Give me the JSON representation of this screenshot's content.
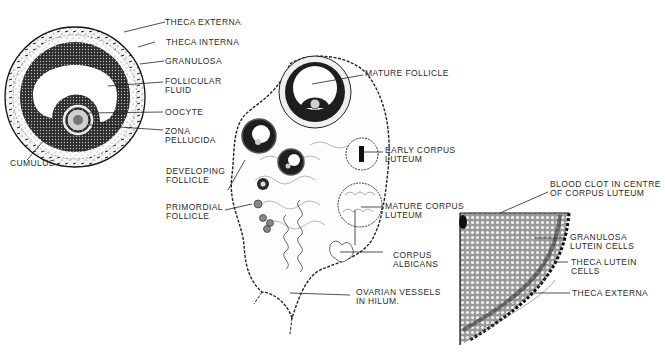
{
  "figure": {
    "type": "anatomical-illustration",
    "colors": {
      "ink": "#1a1a1a",
      "background": "#ffffff",
      "label": "#2a2a2a"
    }
  },
  "panels": {
    "follicle_detail": {
      "labels": [
        {
          "id": "theca-externa",
          "lines": [
            "THECA EXTERNA"
          ]
        },
        {
          "id": "theca-interna",
          "lines": [
            "THECA  INTERNA"
          ]
        },
        {
          "id": "granulosa",
          "lines": [
            "GRANULOSA"
          ]
        },
        {
          "id": "follicular-fluid",
          "lines": [
            "FOLLICULAR",
            "FLUID"
          ]
        },
        {
          "id": "oocyte",
          "lines": [
            "OOCYTE"
          ]
        },
        {
          "id": "zona-pellucida",
          "lines": [
            "ZONA",
            "PELLUCIDA"
          ]
        },
        {
          "id": "cumulus",
          "lines": [
            "CUMULUS"
          ]
        }
      ]
    },
    "ovary_section": {
      "labels": [
        {
          "id": "developing-follicle",
          "lines": [
            "DEVELOPING",
            "FOLLICLE"
          ]
        },
        {
          "id": "primordial-follicle",
          "lines": [
            "PRIMORDIAL",
            "FOLLICLE"
          ]
        },
        {
          "id": "mature-follicle",
          "lines": [
            "MATURE FOLLICLE"
          ]
        },
        {
          "id": "early-corpus-luteum",
          "lines": [
            "EARLY CORPUS",
            "LUTEUM"
          ]
        },
        {
          "id": "mature-corpus-luteum",
          "lines": [
            "MATURE CORPUS",
            "LUTEUM"
          ]
        },
        {
          "id": "corpus-albicans",
          "lines": [
            "CORPUS",
            "ALBICANS"
          ]
        },
        {
          "id": "ovarian-vessels",
          "lines": [
            "OVARIAN VESSELS",
            "IN HILUM."
          ]
        }
      ]
    },
    "corpus_luteum_detail": {
      "labels": [
        {
          "id": "blood-clot",
          "lines": [
            "BLOOD CLOT IN CENTRE",
            "OF CORPUS LUTEUM"
          ]
        },
        {
          "id": "granulosa-lutein",
          "lines": [
            "GRANULOSA",
            "LUTEIN CELLS"
          ]
        },
        {
          "id": "theca-lutein",
          "lines": [
            "THECA LUTEIN",
            "CELLS"
          ]
        },
        {
          "id": "theca-externa-cl",
          "lines": [
            "THECA EXTERNA"
          ]
        }
      ]
    }
  }
}
